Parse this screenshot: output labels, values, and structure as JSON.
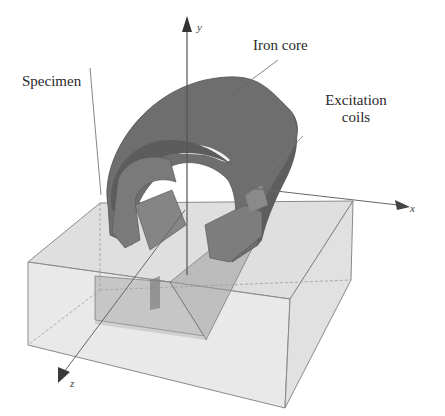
{
  "figure": {
    "labels": {
      "iron_core": "Iron core",
      "specimen": "Specimen",
      "excitation_line1": "Excitation",
      "excitation_line2": "coils"
    },
    "axes": {
      "y": "y",
      "x": "x",
      "z": "z"
    },
    "colors": {
      "core": "#6e6e6e",
      "core_dark": "#5a5a5a",
      "coil": "#7a7a7a",
      "specimen_fill": "#c9c9c9",
      "specimen_edge": "#8a8a8a",
      "leader": "#666666",
      "axis": "#555555"
    }
  }
}
